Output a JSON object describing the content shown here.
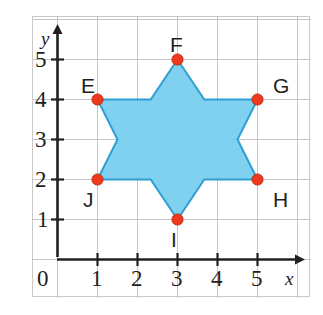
{
  "figure": {
    "type": "coordinate-grid-star",
    "background_color": "#ffffff",
    "frame_color": "#c9c9c9",
    "grid_color": "#c6c6c6",
    "axis_color": "#231f20",
    "shape_fill_color": "#79CFEF",
    "shape_stroke_color": "#2E9FD4",
    "point_color": "#ED3A1C",
    "point_stroke_color": "#B32200"
  },
  "axes": {
    "x_axis_label": "x",
    "y_axis_label": "y",
    "origin_label": "0",
    "x_ticks": [
      "1",
      "2",
      "3",
      "4",
      "5"
    ],
    "y_ticks": [
      "1",
      "2",
      "3",
      "4",
      "5"
    ],
    "x_range": [
      0,
      6
    ],
    "y_range": [
      0,
      6
    ]
  },
  "chart_data": {
    "type": "scatter",
    "title": "",
    "xlabel": "x",
    "ylabel": "y",
    "xlim": [
      0,
      6
    ],
    "ylim": [
      0,
      6
    ],
    "grid": true,
    "legend": "none",
    "shape": {
      "name": "six-pointed star (hexagram) EFGHIJ",
      "outer_points": [
        {
          "label": "E",
          "x": 1,
          "y": 4
        },
        {
          "label": "F",
          "x": 3,
          "y": 5
        },
        {
          "label": "G",
          "x": 5,
          "y": 4
        },
        {
          "label": "H",
          "x": 5,
          "y": 2
        },
        {
          "label": "I",
          "x": 3,
          "y": 1
        },
        {
          "label": "J",
          "x": 1,
          "y": 2
        }
      ],
      "inner_points": [
        {
          "x": 2.33,
          "y": 4
        },
        {
          "x": 3.67,
          "y": 4
        },
        {
          "x": 4.5,
          "y": 3
        },
        {
          "x": 3.67,
          "y": 2
        },
        {
          "x": 2.33,
          "y": 2
        },
        {
          "x": 1.5,
          "y": 3
        }
      ],
      "outline_order": [
        {
          "x": 1,
          "y": 4
        },
        {
          "x": 2.33,
          "y": 4
        },
        {
          "x": 3,
          "y": 5
        },
        {
          "x": 3.67,
          "y": 4
        },
        {
          "x": 5,
          "y": 4
        },
        {
          "x": 4.5,
          "y": 3
        },
        {
          "x": 5,
          "y": 2
        },
        {
          "x": 3.67,
          "y": 2
        },
        {
          "x": 3,
          "y": 1
        },
        {
          "x": 2.33,
          "y": 2
        },
        {
          "x": 1,
          "y": 2
        },
        {
          "x": 1.5,
          "y": 3
        }
      ]
    },
    "vertex_labels": [
      {
        "label": "E",
        "x": 1,
        "y": 4,
        "position": "above-left"
      },
      {
        "label": "F",
        "x": 3,
        "y": 5,
        "position": "above"
      },
      {
        "label": "G",
        "x": 5,
        "y": 4,
        "position": "above-right"
      },
      {
        "label": "H",
        "x": 5,
        "y": 2,
        "position": "below-right"
      },
      {
        "label": "I",
        "x": 3,
        "y": 1,
        "position": "below"
      },
      {
        "label": "J",
        "x": 1,
        "y": 2,
        "position": "below-left"
      }
    ]
  }
}
